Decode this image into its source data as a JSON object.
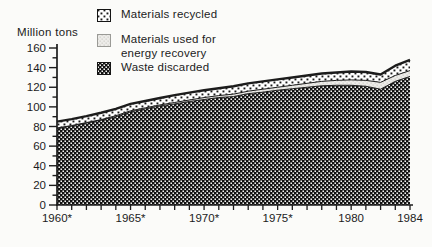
{
  "figure": {
    "ylabel": "Million tons",
    "legend": {
      "items": [
        {
          "key": "materials-recycled",
          "label": "Materials recycled"
        },
        {
          "key": "energy-recovery",
          "label_line1": "Materials used for",
          "label_line2": "energy recovery"
        },
        {
          "key": "waste-discarded",
          "label": "Waste discarded"
        }
      ]
    }
  },
  "colors": {
    "ink": "#1c1c1c",
    "paper": "#fbfbf9"
  },
  "chart_data": {
    "type": "area",
    "stacked": true,
    "title": "",
    "xlabel": "",
    "ylabel": "Million tons",
    "grid": false,
    "legend_position": "top-left",
    "ylim": [
      0,
      160
    ],
    "ytick_step": 20,
    "yminor_step": 10,
    "x": [
      1960,
      1961,
      1962,
      1963,
      1964,
      1965,
      1966,
      1967,
      1968,
      1969,
      1970,
      1971,
      1972,
      1973,
      1974,
      1975,
      1976,
      1977,
      1978,
      1979,
      1980,
      1981,
      1982,
      1983,
      1984
    ],
    "xticks": [
      1960,
      1965,
      1970,
      1975,
      1980,
      1984
    ],
    "xtick_labels": [
      "1960*",
      "1965*",
      "1970*",
      "1975*",
      "1980",
      "1984"
    ],
    "series": [
      {
        "name": "Waste discarded",
        "key": "waste-discarded",
        "pattern": "dark-checker",
        "values": [
          78,
          80.5,
          83.5,
          86.5,
          90,
          95,
          98,
          101,
          103,
          105.5,
          107.5,
          109.5,
          110.5,
          113.5,
          115,
          117,
          118.5,
          120,
          121.5,
          122,
          122,
          121,
          118,
          126,
          131
        ]
      },
      {
        "name": "Materials used for energy recovery",
        "key": "energy-recovery",
        "pattern": "light-stipple",
        "values": [
          0.5,
          0.5,
          0.5,
          0.5,
          1,
          1,
          1,
          1,
          1.5,
          1.5,
          2,
          2,
          2.5,
          2.5,
          3,
          3,
          3.5,
          4,
          4.5,
          5,
          5.5,
          6,
          7,
          6,
          6
        ]
      },
      {
        "name": "Materials recycled",
        "key": "materials-recycled",
        "pattern": "dot-checker",
        "values": [
          6.5,
          6.5,
          6.5,
          7,
          7,
          7,
          7,
          7,
          7.5,
          7.5,
          7.5,
          7.5,
          8,
          8,
          8,
          8,
          8,
          8,
          8,
          8,
          8.5,
          8.5,
          8,
          10,
          11
        ]
      }
    ]
  }
}
